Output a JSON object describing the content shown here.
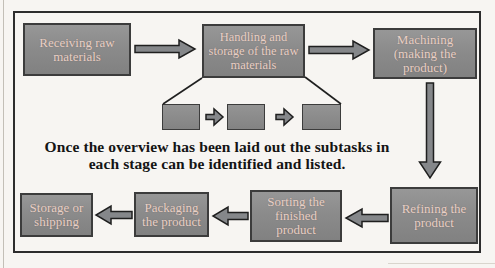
{
  "diagram": {
    "caption": {
      "line1": "Once the overview has been laid out the subtasks in",
      "line2": "each stage can be identified and listed."
    },
    "nodes": [
      {
        "id": "receiving",
        "lines": [
          "Receiving raw",
          "materials"
        ]
      },
      {
        "id": "handling",
        "lines": [
          "Handling and",
          "storage of the raw",
          "materials"
        ]
      },
      {
        "id": "machining",
        "lines": [
          "Machining",
          "(making the",
          "product)"
        ]
      },
      {
        "id": "refining",
        "lines": [
          "Refining the",
          "product"
        ]
      },
      {
        "id": "sorting",
        "lines": [
          "Sorting the",
          "finished",
          "product"
        ]
      },
      {
        "id": "packaging",
        "lines": [
          "Packaging",
          "the product"
        ]
      },
      {
        "id": "storage",
        "lines": [
          "Storage or",
          "shipping"
        ]
      }
    ],
    "colors": {
      "background": "#f7f5f2",
      "frame_border": "#2d2d2d",
      "box_fill": "#8b8b8b",
      "box_border": "#3c3c3c",
      "box_text": "#e9d1c7",
      "arrow_fill": "#85878a",
      "arrow_outline": "#1f1f1f",
      "caption_text": "#141414"
    }
  }
}
